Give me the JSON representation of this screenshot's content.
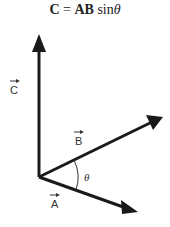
{
  "title": {
    "lhs": "C",
    "eq": " = ",
    "ab": "AB",
    "fn": " sin",
    "theta": "θ"
  },
  "vectors": {
    "c": "C",
    "b": "B",
    "a": "A"
  },
  "angle_label": "θ",
  "colors": {
    "line": "#1a1a1a",
    "text": "#333333"
  }
}
